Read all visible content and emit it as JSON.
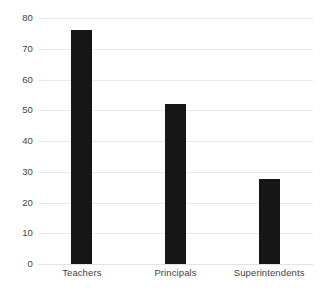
{
  "chart_data": {
    "type": "bar",
    "title": "",
    "subtitle": "",
    "xlabel": "",
    "ylabel": "",
    "categories": [
      "Teachers",
      "Principals",
      "Superintendents"
    ],
    "values": [
      76,
      52,
      27.5
    ],
    "series": [
      {
        "name": "",
        "values": [
          76,
          52,
          27.5
        ]
      }
    ],
    "ylim": [
      0,
      80
    ],
    "y_ticks": [
      0,
      10,
      20,
      30,
      40,
      50,
      60,
      70,
      80
    ],
    "y_tick_labels": [
      "0",
      "10",
      "20",
      "30",
      "40",
      "50",
      "60",
      "70",
      "80"
    ],
    "grid": true,
    "grid_axis": "y",
    "legend": false,
    "legend_position": "none",
    "annotations": [],
    "colors": {
      "bar": "#161616",
      "gridline": "#e9e9e9",
      "text": "#3f3f3f",
      "background": "#ffffff"
    }
  }
}
